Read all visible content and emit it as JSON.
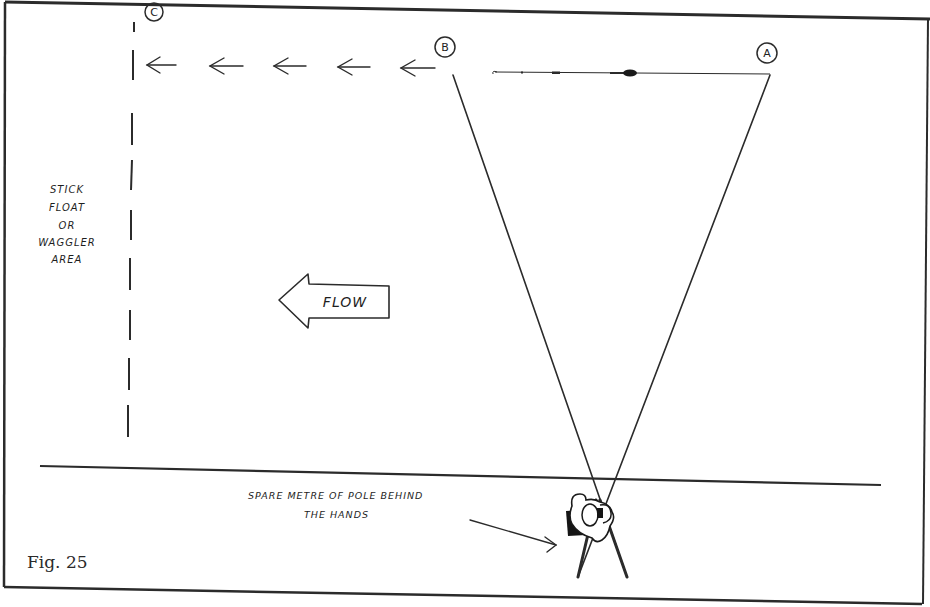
{
  "figure": {
    "caption": "Fig. 25",
    "points": {
      "a": "A",
      "b": "B",
      "c": "C"
    },
    "zone_label": [
      "STICK",
      "FLOAT",
      "OR",
      "WAGGLER",
      "AREA"
    ],
    "flow_label": "FLOW",
    "annotation": [
      "SPARE METRE OF POLE BEHIND",
      "THE HANDS"
    ],
    "arrow_count": 5,
    "colors": {
      "ink": "#1e1e1e",
      "background": "#ffffff"
    }
  }
}
